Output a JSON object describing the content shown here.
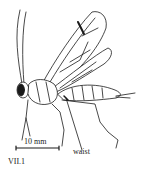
{
  "figure": {
    "scale_label": "10 mm",
    "annotation_label": "waist",
    "figure_id": "VII.1"
  },
  "colors": {
    "ink": "#1a1a1a",
    "background": "#ffffff"
  }
}
